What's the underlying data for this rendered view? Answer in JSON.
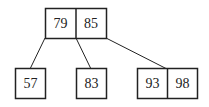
{
  "diagram": {
    "type": "b-tree",
    "root": {
      "keys": [
        "79",
        "85"
      ]
    },
    "children": [
      {
        "keys": [
          "57"
        ]
      },
      {
        "keys": [
          "83"
        ]
      },
      {
        "keys": [
          "93",
          "98"
        ]
      }
    ]
  },
  "colors": {
    "stroke": "#222222",
    "background": "#ffffff",
    "text": "#222222"
  }
}
